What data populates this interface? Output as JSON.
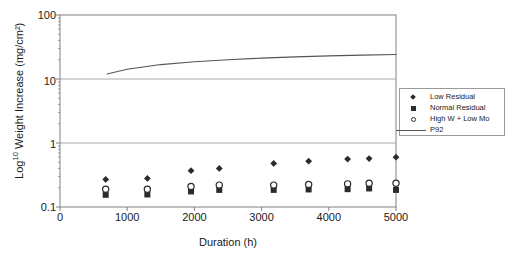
{
  "chart_data": {
    "type": "scatter",
    "title": "",
    "subtitle": "",
    "xlabel": "Duration (h)",
    "ylabel": "Log10 Weight Increase (mg/cm²)",
    "ylabel_base": "Log",
    "ylabel_exp": "10",
    "ylabel_rest": " Weight Increase (mg/cm²)",
    "xlim": [
      0,
      5000
    ],
    "ylim": [
      0.1,
      100
    ],
    "yscale": "log",
    "grid": true,
    "grid_axis": "y",
    "legend_position": "right",
    "xticks": [
      0,
      1000,
      2000,
      3000,
      4000,
      5000
    ],
    "xtick_labels": [
      "0",
      "1000",
      "2000",
      "3000",
      "4000",
      "5000"
    ],
    "yticks": [
      0.1,
      1,
      10,
      100
    ],
    "ytick_labels": [
      "0.1",
      "1",
      "10",
      "100"
    ],
    "series": [
      {
        "name": "Low Residual",
        "marker": "diamond",
        "color": "#2b2b2b",
        "x": [
          680,
          1300,
          1950,
          2370,
          3180,
          3700,
          4280,
          4600,
          5000
        ],
        "y": [
          0.27,
          0.28,
          0.37,
          0.4,
          0.48,
          0.52,
          0.56,
          0.57,
          0.6
        ]
      },
      {
        "name": "Normal Residual",
        "marker": "square",
        "color": "#2b2b2b",
        "x": [
          680,
          1300,
          1950,
          2370,
          3180,
          3700,
          4280,
          4600,
          5000
        ],
        "y": [
          0.155,
          0.157,
          0.175,
          0.185,
          0.185,
          0.188,
          0.19,
          0.195,
          0.185
        ]
      },
      {
        "name": "High W + Low Mo",
        "marker": "open-circle",
        "color": "#2b2b2b",
        "x": [
          680,
          1300,
          1950,
          2370,
          3180,
          3700,
          4280,
          4600,
          5000
        ],
        "y": [
          0.19,
          0.19,
          0.21,
          0.22,
          0.22,
          0.225,
          0.23,
          0.235,
          0.235
        ]
      },
      {
        "name": "P92",
        "marker": "line",
        "color": "#555555",
        "x": [
          700,
          1000,
          1500,
          2000,
          2500,
          3000,
          3500,
          4000,
          4500,
          5000
        ],
        "y": [
          12.0,
          14.2,
          16.8,
          18.6,
          20.0,
          21.2,
          22.2,
          23.0,
          23.6,
          24.2
        ]
      }
    ]
  },
  "legend": {
    "items": [
      {
        "label": "Low Residual",
        "marker": "diamond"
      },
      {
        "label": "Normal Residual",
        "marker": "square"
      },
      {
        "label": "High W + Low Mo",
        "marker": "open-circle"
      },
      {
        "label": "P92",
        "marker": "line"
      }
    ]
  },
  "colors": {
    "marker": "#2b2b2b",
    "line": "#555555",
    "axis": "#808080",
    "grid": "#a8a8a8",
    "background": "#ffffff",
    "text": "#1a1a1a"
  }
}
